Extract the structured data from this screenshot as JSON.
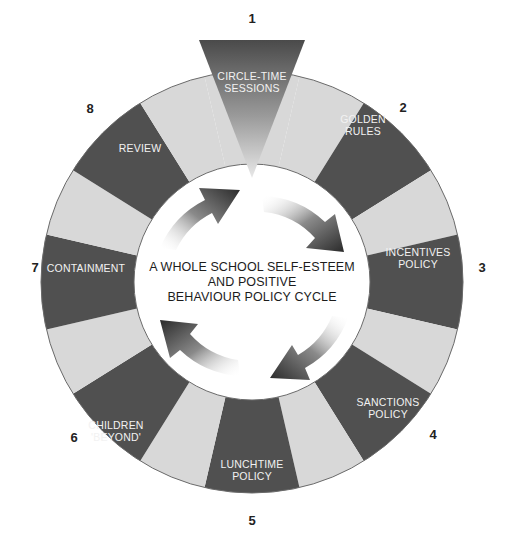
{
  "diagram": {
    "title_lines": [
      "A WHOLE SCHOOL SELF-ESTEEM",
      "AND POSITIVE",
      "BEHAVIOUR POLICY CYCLE"
    ],
    "colors": {
      "dark_segment": "#505050",
      "light_segment": "#d8d8d8",
      "ring_outline": "#6a6a6a",
      "label_text": "#f2f2f2",
      "number_text": "#222222"
    },
    "steps": [
      {
        "number": "1",
        "lines": [
          "CIRCLE-TIME",
          "SESSIONS"
        ]
      },
      {
        "number": "2",
        "lines": [
          "GOLDEN",
          "RULES"
        ]
      },
      {
        "number": "3",
        "lines": [
          "INCENTIVES",
          "POLICY"
        ]
      },
      {
        "number": "4",
        "lines": [
          "SANCTIONS",
          "POLICY"
        ]
      },
      {
        "number": "5",
        "lines": [
          "LUNCHTIME",
          "POLICY"
        ]
      },
      {
        "number": "6",
        "lines": [
          "CHILDREN",
          "'BEYOND'"
        ]
      },
      {
        "number": "7",
        "lines": [
          "CONTAINMENT"
        ]
      },
      {
        "number": "8",
        "lines": [
          "REVIEW"
        ]
      }
    ],
    "cycle_arrows": [
      "arrow-top-left",
      "arrow-top-right",
      "arrow-bottom-right",
      "arrow-bottom-left"
    ]
  }
}
